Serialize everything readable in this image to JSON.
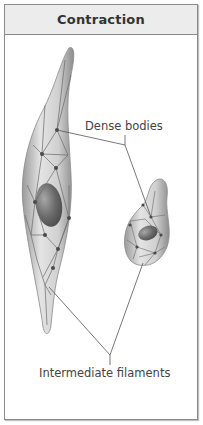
{
  "panel": {
    "title": "Contraction"
  },
  "labels": {
    "dense_bodies": "Dense bodies",
    "intermediate_filaments": "Intermediate filaments"
  },
  "colors": {
    "border": "#8a8a8a",
    "header_bg": "#ececec",
    "cell_fill": "#d6d6d6",
    "nucleus": "#6e6e6e",
    "filament": "#6a6a6a",
    "dense_body": "#4a4a4a"
  },
  "figures": [
    {
      "name": "elongated-smooth-muscle-cell",
      "state": "relaxed-shape"
    },
    {
      "name": "contracted-smooth-muscle-cell",
      "state": "contracted"
    }
  ]
}
